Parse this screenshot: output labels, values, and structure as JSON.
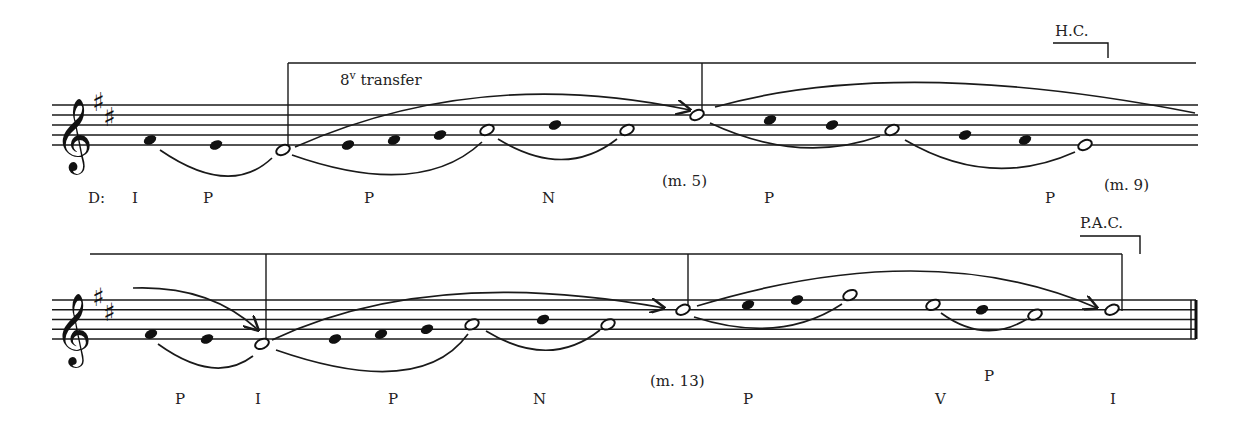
{
  "key": "D major",
  "staves": [
    {
      "top": 105,
      "bottom": 145,
      "x_start": 52,
      "x_end": 1198,
      "step": 5,
      "key_signature": [
        "F#",
        "C#"
      ],
      "beam_line": {
        "y": 63,
        "x_start": 288,
        "x_end": 1196
      },
      "stems": [
        {
          "x": 288,
          "y_top": 63,
          "y_bottom": 148
        },
        {
          "x": 702,
          "y_top": 63,
          "y_bottom": 114
        }
      ],
      "notes": [
        {
          "x": 150,
          "pitch": "F#4",
          "step": 1,
          "type": "filled"
        },
        {
          "x": 216,
          "pitch": "E4",
          "step": 0,
          "type": "filled"
        },
        {
          "x": 283,
          "pitch": "D4",
          "step": -1,
          "type": "open"
        },
        {
          "x": 348,
          "pitch": "E4",
          "step": 0,
          "type": "filled"
        },
        {
          "x": 394,
          "pitch": "F#4",
          "step": 1,
          "type": "filled"
        },
        {
          "x": 440,
          "pitch": "G4",
          "step": 2,
          "type": "filled"
        },
        {
          "x": 487,
          "pitch": "A4",
          "step": 3,
          "type": "open"
        },
        {
          "x": 555,
          "pitch": "B4",
          "step": 4,
          "type": "filled"
        },
        {
          "x": 627,
          "pitch": "A4",
          "step": 3,
          "type": "open"
        },
        {
          "x": 697,
          "pitch": "D5",
          "step": 6,
          "type": "open"
        },
        {
          "x": 770,
          "pitch": "C#5",
          "step": 5,
          "type": "filled"
        },
        {
          "x": 832,
          "pitch": "B4",
          "step": 4,
          "type": "filled"
        },
        {
          "x": 892,
          "pitch": "A4",
          "step": 3,
          "type": "open"
        },
        {
          "x": 965,
          "pitch": "G4",
          "step": 2,
          "type": "filled"
        },
        {
          "x": 1025,
          "pitch": "F#4",
          "step": 1,
          "type": "filled"
        },
        {
          "x": 1085,
          "pitch": "E4",
          "step": 0,
          "type": "open"
        }
      ],
      "slurs": [
        {
          "d": "M160,150 Q230,198 272,158"
        },
        {
          "d": "M292,155 Q420,200 482,142"
        },
        {
          "d": "M498,139 Q565,180 617,139"
        },
        {
          "d": "M710,123 Q800,165 880,136"
        },
        {
          "d": "M905,140 Q990,190 1075,152"
        },
        {
          "d": "M295,147 Q480,65 690,110",
          "arrow": true
        },
        {
          "d": "M715,107 Q900,55 1195,113"
        }
      ],
      "annotations": {
        "octave_transfer": {
          "text_main": "8",
          "text_sup": "v",
          "text_rest": " transfer",
          "x": 340,
          "y": 85
        },
        "cadence": {
          "text": "H.C.",
          "x": 1055,
          "y": 36,
          "bracket": {
            "x1": 1053,
            "x2": 1108,
            "y": 43,
            "y2": 58
          }
        },
        "measures": [
          {
            "text": "(m. 5)",
            "x": 662,
            "y": 186
          },
          {
            "text": "(m. 9)",
            "x": 1104,
            "y": 190
          }
        ],
        "analysis": [
          {
            "text": "D:",
            "x": 88,
            "y": 203
          },
          {
            "text": "I",
            "x": 132,
            "y": 203
          },
          {
            "text": "P",
            "x": 203,
            "y": 203
          },
          {
            "text": "P",
            "x": 364,
            "y": 203
          },
          {
            "text": "N",
            "x": 542,
            "y": 203
          },
          {
            "text": "P",
            "x": 764,
            "y": 203
          },
          {
            "text": "P",
            "x": 1045,
            "y": 203
          }
        ]
      }
    },
    {
      "top": 300,
      "bottom": 339,
      "x_start": 52,
      "x_end": 1196,
      "step": 4.85,
      "key_signature": [
        "F#",
        "C#"
      ],
      "beam_line": {
        "y": 254,
        "x_start": 90,
        "x_end": 1122
      },
      "stems": [
        {
          "x": 266,
          "y_top": 254,
          "y_bottom": 343
        },
        {
          "x": 688,
          "y_top": 254,
          "y_bottom": 311
        },
        {
          "x": 1122,
          "y_top": 254,
          "y_bottom": 311
        }
      ],
      "notes": [
        {
          "x": 151,
          "pitch": "F#4",
          "step": 1,
          "type": "filled"
        },
        {
          "x": 207,
          "pitch": "E4",
          "step": 0,
          "type": "filled"
        },
        {
          "x": 262,
          "pitch": "D4",
          "step": -1,
          "type": "open"
        },
        {
          "x": 335,
          "pitch": "E4",
          "step": 0,
          "type": "filled"
        },
        {
          "x": 381,
          "pitch": "F#4",
          "step": 1,
          "type": "filled"
        },
        {
          "x": 427,
          "pitch": "G4",
          "step": 2,
          "type": "filled"
        },
        {
          "x": 472,
          "pitch": "A4",
          "step": 3,
          "type": "open"
        },
        {
          "x": 543,
          "pitch": "B4",
          "step": 4,
          "type": "filled"
        },
        {
          "x": 608,
          "pitch": "A4",
          "step": 3,
          "type": "open"
        },
        {
          "x": 683,
          "pitch": "D5",
          "step": 6,
          "type": "open"
        },
        {
          "x": 748,
          "pitch": "E5",
          "step": 7,
          "type": "filled"
        },
        {
          "x": 797,
          "pitch": "F#5",
          "step": 8,
          "type": "filled"
        },
        {
          "x": 850,
          "pitch": "G5",
          "step": 9,
          "type": "open"
        },
        {
          "x": 933,
          "pitch": "E5",
          "step": 7,
          "type": "open"
        },
        {
          "x": 982,
          "pitch": "D5",
          "step": 6,
          "type": "filled"
        },
        {
          "x": 1035,
          "pitch": "C#5",
          "step": 5,
          "type": "open"
        },
        {
          "x": 1112,
          "pitch": "D5",
          "step": 6,
          "type": "open"
        }
      ],
      "slurs": [
        {
          "d": "M158,344 Q215,385 253,356"
        },
        {
          "d": "M276,350 Q420,400 468,334"
        },
        {
          "d": "M486,331 Q550,370 600,330"
        },
        {
          "d": "M694,317 Q780,345 842,304"
        },
        {
          "d": "M941,313 Q985,345 1027,319"
        },
        {
          "d": "M133,288 Q210,285 258,330",
          "arrow": true
        },
        {
          "d": "M272,340 Q430,265 664,308",
          "arrow": true
        },
        {
          "d": "M697,306 Q930,235 1097,308",
          "arrow": true
        }
      ],
      "final_barline": {
        "x1": 1191,
        "x2": 1196,
        "y_top": 300,
        "y_bottom": 339
      },
      "annotations": {
        "cadence": {
          "text": "P.A.C.",
          "x": 1080,
          "y": 228,
          "bracket": {
            "x1": 1080,
            "x2": 1140,
            "y": 236,
            "y2": 254
          }
        },
        "measures": [
          {
            "text": "(m. 13)",
            "x": 650,
            "y": 386
          }
        ],
        "analysis": [
          {
            "text": "P",
            "x": 175,
            "y": 404
          },
          {
            "text": "I",
            "x": 255,
            "y": 404
          },
          {
            "text": "P",
            "x": 388,
            "y": 404
          },
          {
            "text": "N",
            "x": 533,
            "y": 404
          },
          {
            "text": "P",
            "x": 743,
            "y": 404
          },
          {
            "text": "P",
            "x": 984,
            "y": 381
          },
          {
            "text": "V",
            "x": 935,
            "y": 404
          },
          {
            "text": "I",
            "x": 1110,
            "y": 404
          }
        ]
      }
    }
  ]
}
